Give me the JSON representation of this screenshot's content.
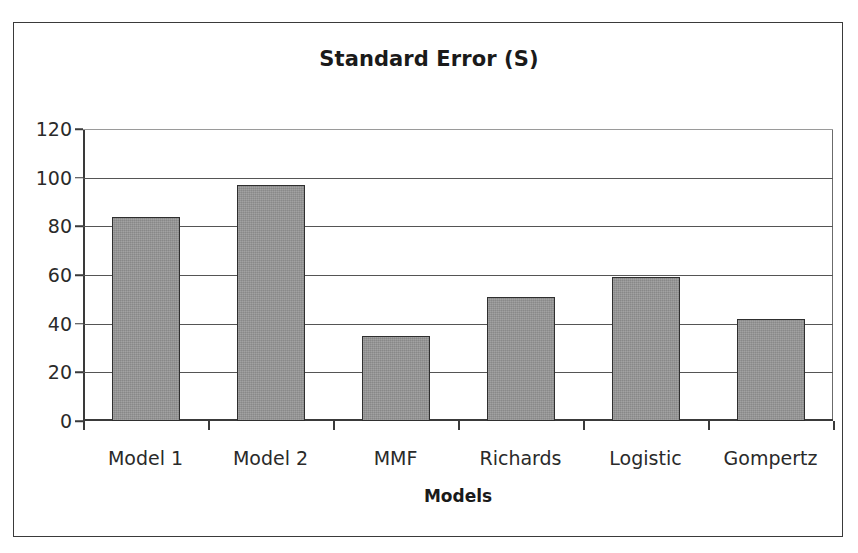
{
  "chart_data": {
    "type": "bar",
    "title": "Standard Error (S)",
    "xlabel": "Models",
    "ylabel": "",
    "categories": [
      "Model 1",
      "Model 2",
      "MMF",
      "Richards",
      "Logistic",
      "Gompertz"
    ],
    "values": [
      84,
      97,
      35,
      51,
      59,
      42
    ],
    "ylim": [
      0,
      120
    ],
    "ytick_labels": [
      "0",
      "20",
      "40",
      "60",
      "80",
      "100",
      "120"
    ],
    "ytick_values": [
      0,
      20,
      40,
      60,
      80,
      100,
      120
    ],
    "grid": true,
    "grid_axis": "y",
    "legend": false,
    "legend_position": "none",
    "series": [
      {
        "name": "Standard Error (S)",
        "values": [
          84,
          97,
          35,
          51,
          59,
          42
        ],
        "color": "#989898",
        "edge_color": "#2f2f2f"
      }
    ],
    "annotations": []
  },
  "figure": {
    "background_color": "#ffffff",
    "border_color": "#3a3a3a",
    "axis_color": "#3a3a3a",
    "gridline_color": "#555555"
  }
}
